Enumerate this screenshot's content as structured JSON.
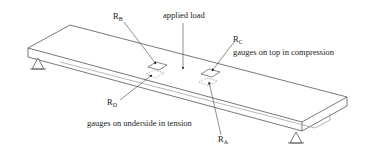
{
  "diagram": {
    "labels": {
      "applied_load": "applied load",
      "top_note": "gauges on top in compression",
      "bottom_note": "gauges on underside in tension"
    },
    "gauges": [
      {
        "id": "B",
        "main": "R",
        "sub": "B",
        "position": "top-left"
      },
      {
        "id": "C",
        "main": "R",
        "sub": "C",
        "position": "top-right"
      },
      {
        "id": "D",
        "main": "R",
        "sub": "D",
        "position": "underside-left"
      },
      {
        "id": "A",
        "main": "R",
        "sub": "A",
        "position": "underside-right"
      }
    ],
    "colors": {
      "line": "#555555",
      "gauge_dotted": "#777777",
      "text": "#222222",
      "background": "#ffffff"
    }
  }
}
